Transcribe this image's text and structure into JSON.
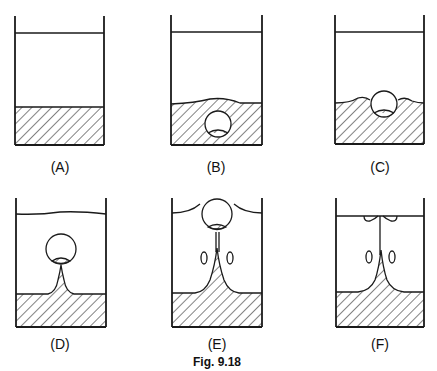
{
  "figure": {
    "caption": "Fig. 9.18",
    "panels": [
      {
        "id": "A",
        "label": "(A)",
        "description": "Beaker with liquid layer over hatched sediment layer, flat interface"
      },
      {
        "id": "B",
        "label": "(B)",
        "description": "Bubble forming inside sediment layer, interface slightly raised"
      },
      {
        "id": "C",
        "label": "(C)",
        "description": "Bubble emerging at sediment surface, interface disturbed"
      },
      {
        "id": "D",
        "label": "(D)",
        "description": "Bubble rising through liquid, carrying sediment tail; wavy liquid surface"
      },
      {
        "id": "E",
        "label": "(E)",
        "description": "Bubble at liquid surface with thin sediment column and side vortices"
      },
      {
        "id": "F",
        "label": "(F)",
        "description": "Bubble burst at surface, residual sediment column and vortices"
      }
    ]
  },
  "colors": {
    "ink": "#1a1a1a",
    "background": "#ffffff"
  }
}
